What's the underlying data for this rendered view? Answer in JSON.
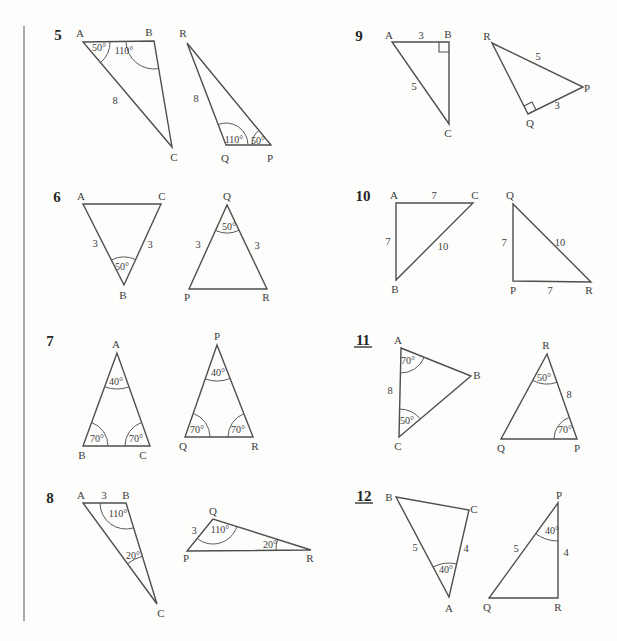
{
  "page": {
    "background": "#fdfdfc",
    "canvas": {
      "width": 617,
      "height": 641
    },
    "stroke_color": "#4e4e4e",
    "arc_color": "#5a5a5a",
    "label_color": "#3c3c3c",
    "number_color": "#262626",
    "divider": {
      "x": 24,
      "y_top": 26,
      "y_bottom": 621,
      "thickness": 2,
      "color": "#a9a9a9"
    }
  },
  "problems": [
    {
      "number": "5",
      "underlined": false,
      "number_pos": [
        58,
        35
      ],
      "triangles": [
        {
          "name": "triangle-ABC",
          "vertices": [
            [
              83,
              42
            ],
            [
              154,
              41
            ],
            [
              172,
              147
            ]
          ],
          "vertex_labels": [
            {
              "text": "A",
              "x": 80,
              "y": 33
            },
            {
              "text": "B",
              "x": 149,
              "y": 32
            },
            {
              "text": "C",
              "x": 174,
              "y": 157
            }
          ],
          "side_labels": [
            {
              "text": "8",
              "x": 115,
              "y": 100
            }
          ],
          "angle_marks": [
            {
              "text": "50°",
              "vertex": 0,
              "x": 99,
              "y": 47,
              "r": 27
            },
            {
              "text": "110°",
              "vertex": 1,
              "x": 124,
              "y": 50,
              "r": 28
            }
          ],
          "right_angles": []
        },
        {
          "name": "triangle-RQP",
          "vertices": [
            [
              187,
              43
            ],
            [
              226,
              145
            ],
            [
              271,
              145
            ]
          ],
          "vertex_labels": [
            {
              "text": "R",
              "x": 183,
              "y": 33
            },
            {
              "text": "Q",
              "x": 225,
              "y": 158
            },
            {
              "text": "P",
              "x": 270,
              "y": 158
            }
          ],
          "side_labels": [
            {
              "text": "8",
              "x": 196,
              "y": 98
            }
          ],
          "angle_marks": [
            {
              "text": "110°",
              "vertex": 1,
              "x": 234,
              "y": 139,
              "r": 22
            },
            {
              "text": "50°",
              "vertex": 2,
              "x": 258,
              "y": 140,
              "r": 19
            }
          ],
          "right_angles": []
        }
      ]
    },
    {
      "number": "6",
      "underlined": false,
      "number_pos": [
        57,
        197
      ],
      "triangles": [
        {
          "name": "triangle-ACB",
          "vertices": [
            [
              83,
              204
            ],
            [
              161,
              204
            ],
            [
              124,
              285
            ]
          ],
          "vertex_labels": [
            {
              "text": "A",
              "x": 81,
              "y": 196
            },
            {
              "text": "C",
              "x": 162,
              "y": 196
            },
            {
              "text": "B",
              "x": 123,
              "y": 295
            }
          ],
          "side_labels": [
            {
              "text": "3",
              "x": 95,
              "y": 243
            },
            {
              "text": "3",
              "x": 150,
              "y": 244
            }
          ],
          "angle_marks": [
            {
              "text": "50°",
              "vertex": 2,
              "x": 122,
              "y": 266,
              "r": 28
            }
          ],
          "right_angles": []
        },
        {
          "name": "triangle-QPR",
          "vertices": [
            [
              227,
              205
            ],
            [
              189,
              289
            ],
            [
              267,
              289
            ]
          ],
          "vertex_labels": [
            {
              "text": "Q",
              "x": 227,
              "y": 196
            },
            {
              "text": "P",
              "x": 187,
              "y": 297
            },
            {
              "text": "R",
              "x": 266,
              "y": 297
            }
          ],
          "side_labels": [
            {
              "text": "3",
              "x": 198,
              "y": 244
            },
            {
              "text": "3",
              "x": 257,
              "y": 245
            }
          ],
          "angle_marks": [
            {
              "text": "50°",
              "vertex": 0,
              "x": 229,
              "y": 226,
              "r": 28
            }
          ],
          "right_angles": []
        }
      ]
    },
    {
      "number": "7",
      "underlined": false,
      "number_pos": [
        50,
        341
      ],
      "triangles": [
        {
          "name": "triangle-ABC",
          "vertices": [
            [
              117,
              353
            ],
            [
              83,
              446
            ],
            [
              150,
              446
            ]
          ],
          "vertex_labels": [
            {
              "text": "A",
              "x": 116,
              "y": 344
            },
            {
              "text": "B",
              "x": 82,
              "y": 455
            },
            {
              "text": "C",
              "x": 143,
              "y": 455
            }
          ],
          "side_labels": [],
          "angle_marks": [
            {
              "text": "40°",
              "vertex": 0,
              "x": 116,
              "y": 381,
              "r": 36
            },
            {
              "text": "70°",
              "vertex": 1,
              "x": 97,
              "y": 438,
              "r": 25
            },
            {
              "text": "70°",
              "vertex": 2,
              "x": 136,
              "y": 438,
              "r": 25
            }
          ],
          "right_angles": []
        },
        {
          "name": "triangle-PQR",
          "vertices": [
            [
              217,
              345
            ],
            [
              185,
              437
            ],
            [
              253,
              437
            ]
          ],
          "vertex_labels": [
            {
              "text": "P",
              "x": 217,
              "y": 336
            },
            {
              "text": "Q",
              "x": 183,
              "y": 446
            },
            {
              "text": "R",
              "x": 255,
              "y": 446
            }
          ],
          "side_labels": [],
          "angle_marks": [
            {
              "text": "40°",
              "vertex": 0,
              "x": 218,
              "y": 372,
              "r": 36
            },
            {
              "text": "70°",
              "vertex": 1,
              "x": 197,
              "y": 429,
              "r": 25
            },
            {
              "text": "70°",
              "vertex": 2,
              "x": 238,
              "y": 429,
              "r": 25
            }
          ],
          "right_angles": []
        }
      ]
    },
    {
      "number": "8",
      "underlined": false,
      "number_pos": [
        50,
        498
      ],
      "triangles": [
        {
          "name": "triangle-ABC",
          "vertices": [
            [
              83,
              503
            ],
            [
              126,
              503
            ],
            [
              157,
              604
            ]
          ],
          "vertex_labels": [
            {
              "text": "A",
              "x": 81,
              "y": 495
            },
            {
              "text": "B",
              "x": 126,
              "y": 495
            },
            {
              "text": "C",
              "x": 161,
              "y": 613
            }
          ],
          "side_labels": [
            {
              "text": "3",
              "x": 104,
              "y": 495
            }
          ],
          "angle_marks": [
            {
              "text": "110°",
              "vertex": 1,
              "x": 118,
              "y": 513,
              "r": 26
            },
            {
              "text": "20°",
              "vertex": 2,
              "x": 133,
              "y": 555,
              "r": 50
            }
          ],
          "right_angles": []
        },
        {
          "name": "triangle-QPR",
          "vertices": [
            [
              213,
              519
            ],
            [
              187,
              551
            ],
            [
              311,
              550
            ]
          ],
          "vertex_labels": [
            {
              "text": "Q",
              "x": 213,
              "y": 511
            },
            {
              "text": "P",
              "x": 186,
              "y": 558
            },
            {
              "text": "R",
              "x": 310,
              "y": 558
            }
          ],
          "side_labels": [
            {
              "text": "3",
              "x": 194,
              "y": 530
            }
          ],
          "angle_marks": [
            {
              "text": "110°",
              "vertex": 0,
              "x": 220,
              "y": 529,
              "r": 25
            },
            {
              "text": "20°",
              "vertex": 2,
              "x": 270,
              "y": 544,
              "r": 35
            }
          ],
          "right_angles": []
        }
      ]
    },
    {
      "number": "9",
      "underlined": false,
      "number_pos": [
        359,
        36
      ],
      "triangles": [
        {
          "name": "triangle-ABC",
          "vertices": [
            [
              392,
              42
            ],
            [
              449,
              42
            ],
            [
              449,
              124
            ]
          ],
          "vertex_labels": [
            {
              "text": "A",
              "x": 389,
              "y": 35
            },
            {
              "text": "B",
              "x": 448,
              "y": 34
            },
            {
              "text": "C",
              "x": 448,
              "y": 133
            }
          ],
          "side_labels": [
            {
              "text": "3",
              "x": 421,
              "y": 35
            },
            {
              "text": "5",
              "x": 414,
              "y": 86
            }
          ],
          "angle_marks": [],
          "right_angles": [
            {
              "vertex": 1,
              "size": 10
            }
          ]
        },
        {
          "name": "triangle-RPQ",
          "vertices": [
            [
              492,
              43
            ],
            [
              583,
              87
            ],
            [
              528,
              114
            ]
          ],
          "vertex_labels": [
            {
              "text": "R",
              "x": 487,
              "y": 36
            },
            {
              "text": "P",
              "x": 587,
              "y": 88
            },
            {
              "text": "Q",
              "x": 530,
              "y": 123
            }
          ],
          "side_labels": [
            {
              "text": "5",
              "x": 538,
              "y": 56
            },
            {
              "text": "3",
              "x": 557,
              "y": 105
            }
          ],
          "angle_marks": [],
          "right_angles": [
            {
              "vertex": 2,
              "size": 9
            }
          ]
        }
      ]
    },
    {
      "number": "10",
      "underlined": false,
      "number_pos": [
        363,
        196
      ],
      "triangles": [
        {
          "name": "triangle-ACB",
          "vertices": [
            [
              396,
              203
            ],
            [
              473,
              203
            ],
            [
              396,
              280
            ]
          ],
          "vertex_labels": [
            {
              "text": "A",
              "x": 394,
              "y": 195
            },
            {
              "text": "C",
              "x": 475,
              "y": 195
            },
            {
              "text": "B",
              "x": 395,
              "y": 289
            }
          ],
          "side_labels": [
            {
              "text": "7",
              "x": 434,
              "y": 195
            },
            {
              "text": "7",
              "x": 388,
              "y": 241
            },
            {
              "text": "10",
              "x": 443,
              "y": 246
            }
          ],
          "angle_marks": [],
          "right_angles": []
        },
        {
          "name": "triangle-QPR",
          "vertices": [
            [
              513,
              204
            ],
            [
              513,
              281
            ],
            [
              591,
              282
            ]
          ],
          "vertex_labels": [
            {
              "text": "Q",
              "x": 510,
              "y": 195
            },
            {
              "text": "P",
              "x": 513,
              "y": 290
            },
            {
              "text": "R",
              "x": 589,
              "y": 290
            }
          ],
          "side_labels": [
            {
              "text": "7",
              "x": 504,
              "y": 242
            },
            {
              "text": "10",
              "x": 560,
              "y": 242
            },
            {
              "text": "7",
              "x": 550,
              "y": 290
            }
          ],
          "angle_marks": [],
          "right_angles": []
        }
      ]
    },
    {
      "number": "11",
      "underlined": true,
      "number_pos": [
        363,
        340
      ],
      "triangles": [
        {
          "name": "triangle-ABC",
          "vertices": [
            [
              401,
              348
            ],
            [
              471,
              376
            ],
            [
              399,
              437
            ]
          ],
          "vertex_labels": [
            {
              "text": "A",
              "x": 398,
              "y": 340
            },
            {
              "text": "B",
              "x": 477,
              "y": 375
            },
            {
              "text": "C",
              "x": 398,
              "y": 446
            }
          ],
          "side_labels": [
            {
              "text": "8",
              "x": 390,
              "y": 390
            }
          ],
          "angle_marks": [
            {
              "text": "70°",
              "vertex": 0,
              "x": 408,
              "y": 360,
              "r": 25
            },
            {
              "text": "50°",
              "vertex": 2,
              "x": 407,
              "y": 420,
              "r": 28
            }
          ],
          "right_angles": []
        },
        {
          "name": "triangle-RQP",
          "vertices": [
            [
              547,
              354
            ],
            [
              501,
              439
            ],
            [
              577,
              439
            ]
          ],
          "vertex_labels": [
            {
              "text": "R",
              "x": 546,
              "y": 345
            },
            {
              "text": "Q",
              "x": 501,
              "y": 448
            },
            {
              "text": "P",
              "x": 577,
              "y": 448
            }
          ],
          "side_labels": [
            {
              "text": "8",
              "x": 569,
              "y": 394
            }
          ],
          "angle_marks": [
            {
              "text": "50°",
              "vertex": 0,
              "x": 544,
              "y": 377,
              "r": 30
            },
            {
              "text": "70°",
              "vertex": 2,
              "x": 565,
              "y": 429,
              "r": 23
            }
          ],
          "right_angles": []
        }
      ]
    },
    {
      "number": "12",
      "underlined": true,
      "number_pos": [
        364,
        496
      ],
      "triangles": [
        {
          "name": "triangle-BCA",
          "vertices": [
            [
              396,
              497
            ],
            [
              469,
              510
            ],
            [
              449,
              597
            ]
          ],
          "vertex_labels": [
            {
              "text": "B",
              "x": 389,
              "y": 497
            },
            {
              "text": "C",
              "x": 474,
              "y": 509
            },
            {
              "text": "A",
              "x": 449,
              "y": 608
            }
          ],
          "side_labels": [
            {
              "text": "5",
              "x": 415,
              "y": 547
            },
            {
              "text": "4",
              "x": 466,
              "y": 548
            }
          ],
          "angle_marks": [
            {
              "text": "40°",
              "vertex": 2,
              "x": 446,
              "y": 569,
              "r": 34
            }
          ],
          "right_angles": []
        },
        {
          "name": "triangle-PQR",
          "vertices": [
            [
              558,
              503
            ],
            [
              489,
              598
            ],
            [
              558,
              598
            ]
          ],
          "vertex_labels": [
            {
              "text": "P",
              "x": 559,
              "y": 495
            },
            {
              "text": "Q",
              "x": 487,
              "y": 607
            },
            {
              "text": "R",
              "x": 558,
              "y": 607
            }
          ],
          "side_labels": [
            {
              "text": "5",
              "x": 516,
              "y": 548
            },
            {
              "text": "4",
              "x": 566,
              "y": 552
            }
          ],
          "angle_marks": [
            {
              "text": "40°",
              "vertex": 0,
              "x": 552,
              "y": 530,
              "r": 38
            }
          ],
          "right_angles": []
        }
      ]
    }
  ]
}
